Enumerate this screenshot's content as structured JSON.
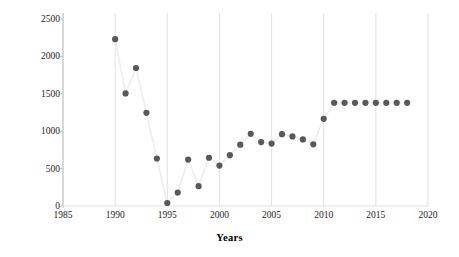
{
  "chart_data": {
    "type": "scatter",
    "title": "",
    "xlabel": "Years",
    "ylabel": "Quantity Used (tonnes)",
    "xlim": [
      1985,
      2020
    ],
    "ylim": [
      0,
      2500
    ],
    "xticks": [
      1985,
      1990,
      1995,
      2000,
      2005,
      2010,
      2015,
      2020
    ],
    "yticks": [
      0,
      500,
      1000,
      1500,
      2000,
      2500
    ],
    "grid": "vertical-only",
    "legend": "none",
    "marker_color": "#595959",
    "line_color": "#ededed",
    "axis_color": "#d9d9d9",
    "x": [
      1990,
      1991,
      1992,
      1993,
      1994,
      1995,
      1996,
      1997,
      1998,
      1999,
      2000,
      2001,
      2002,
      2003,
      2004,
      2005,
      2006,
      2007,
      2008,
      2009,
      2010,
      2011,
      2012,
      2013,
      2014,
      2015,
      2016,
      2017,
      2018
    ],
    "values": [
      2230,
      1505,
      1845,
      1245,
      635,
      40,
      180,
      620,
      265,
      645,
      540,
      680,
      820,
      965,
      855,
      835,
      960,
      930,
      890,
      825,
      1165,
      1380,
      1380,
      1380,
      1380,
      1380,
      1380,
      1380,
      1380
    ]
  }
}
